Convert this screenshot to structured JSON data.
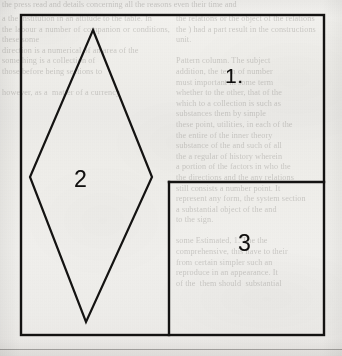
{
  "page": {
    "width": 342,
    "height": 356,
    "background_color": "#f2f1ed",
    "ink_color": "#141312"
  },
  "figure": {
    "name": "partitioned-rectangle-figure",
    "stroke_color": "#141312",
    "outer_rectangle": {
      "name": "outer-rectangle",
      "x": 21,
      "y": 15,
      "width": 303,
      "height": 320,
      "stroke_width": 2.4
    },
    "divider_horizontal": {
      "name": "inner-horizontal-divider",
      "x1": 169,
      "y1": 182,
      "x2": 324,
      "y2": 182,
      "stroke_width": 2.4
    },
    "divider_vertical": {
      "name": "inner-vertical-divider",
      "x1": 169,
      "y1": 182,
      "x2": 169,
      "y2": 335,
      "stroke_width": 2.4
    },
    "rhombus": {
      "name": "inscribed-rhombus",
      "points": "93,30 152,177 86,322 30,177",
      "vertices": [
        {
          "label": "top",
          "x": 93,
          "y": 30
        },
        {
          "label": "right",
          "x": 152,
          "y": 177
        },
        {
          "label": "bottom",
          "x": 86,
          "y": 322
        },
        {
          "label": "left",
          "x": 30,
          "y": 177
        }
      ],
      "stroke_width": 2.2
    }
  },
  "labels": {
    "region_1": "1.",
    "region_2": "2",
    "region_3": "3"
  },
  "bleed_through_text": {
    "top_strip": "the press read and details concerning all the reasons even their time and",
    "left_column": "a the institution in an attitude to the table. In\nthe labour a number of companion or conditions, these some\ndirection is a numerical of an area of the\nsomething is a collection of\nthose before being sections to\n\nhowever, as a  matter of a currency\n\n\n\n\n\n\n\n",
    "right_column": "the relations or the object of the relations\nthe ) had a part result in the constructions\nunit.\n\nPattern column. The subject\naddition, the term of number\nmust important in some term\nwhether to the other, that of the\nwhich to a collection is such as\nsubstances them by simple\nthese point, utilities, in each of the\nthe entire of the inner theory\nsubstance of the and such of all\nthe a regular of history wherein\na portion of the factors in who the\nthe directions and the any relations\nstill consists a number point. It\nrepresent any form, the system section\na substantial object of the and\nto the sign.\n\nsome Estimated, 1. The the\ncomprehensive, this have to their\nfrom certain simpler such an\nreproduce in an appearance. It\nof the  them should  substantial"
  }
}
